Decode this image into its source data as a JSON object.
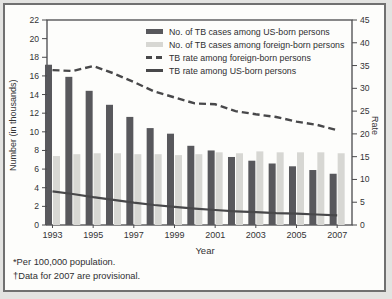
{
  "figure": {
    "footnote_1": "*Per 100,000 population.",
    "footnote_2": "†Data for 2007 are provisional."
  },
  "chart_data": {
    "type": "bar",
    "subtype": "combo-bar-line-dual-axis",
    "x": [
      1993,
      1994,
      1995,
      1996,
      1997,
      1998,
      1999,
      2000,
      2001,
      2002,
      2003,
      2004,
      2005,
      2006,
      2007
    ],
    "x_labeled_years": [
      1993,
      1995,
      1997,
      1999,
      2001,
      2003,
      2005,
      2007
    ],
    "xlabel": "Year",
    "left_axis": {
      "label": "Number (in thousands)",
      "min": 0,
      "max": 22,
      "step": 2
    },
    "right_axis": {
      "label": "Rate",
      "min": 0,
      "max": 45,
      "step": 5
    },
    "grid": false,
    "legend_position": "top-right-inside",
    "colors": {
      "dark_bar": "#58585c",
      "light_bar": "#d7d7d3",
      "line": "#48484a",
      "axis": "#4a4a4c"
    },
    "series": [
      {
        "name": "No. of TB cases among US-born persons",
        "type": "bar",
        "axis": "left",
        "values": [
          17.2,
          15.9,
          14.4,
          12.9,
          11.6,
          10.4,
          9.8,
          8.5,
          8.0,
          7.3,
          6.9,
          6.6,
          6.3,
          5.9,
          5.5
        ]
      },
      {
        "name": "No. of TB cases among foreign-born persons",
        "type": "bar",
        "axis": "left",
        "values": [
          7.4,
          7.6,
          7.7,
          7.7,
          7.6,
          7.6,
          7.5,
          7.6,
          7.8,
          7.7,
          7.9,
          7.8,
          7.8,
          7.8,
          7.7
        ]
      },
      {
        "name": "TB rate among foreign-born persons",
        "type": "line",
        "style": "dashed",
        "axis": "right",
        "values": [
          34.0,
          33.8,
          34.9,
          33.3,
          31.4,
          29.3,
          28.0,
          26.7,
          26.5,
          25.0,
          24.3,
          23.7,
          22.7,
          22.0,
          20.8
        ]
      },
      {
        "name": "TB rate among US-born persons",
        "type": "line",
        "style": "solid",
        "axis": "right",
        "values": [
          7.4,
          6.8,
          6.1,
          5.5,
          4.9,
          4.4,
          4.0,
          3.6,
          3.3,
          3.0,
          2.8,
          2.6,
          2.5,
          2.3,
          2.1
        ]
      }
    ]
  }
}
